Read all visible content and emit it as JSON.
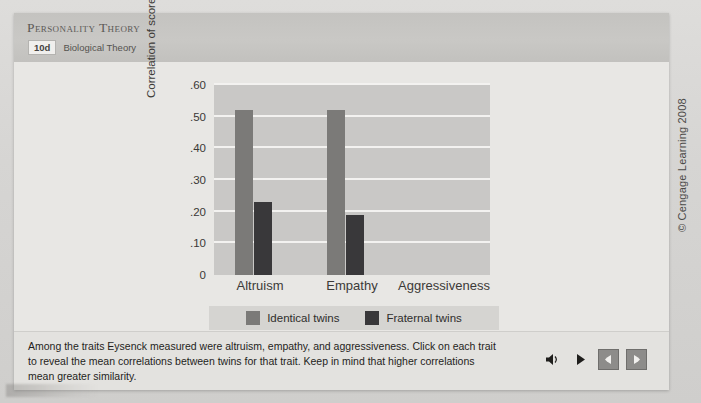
{
  "header": {
    "title": "Personality Theory",
    "chapter_number": "10d",
    "chapter_name": "Biological Theory"
  },
  "chart_data": {
    "type": "bar",
    "title": "",
    "xlabel": "",
    "ylabel": "Correlation of scores",
    "categories": [
      "Altruism",
      "Empathy",
      "Aggressiveness"
    ],
    "series": [
      {
        "name": "Identical twins",
        "color": "#7b7a78",
        "values": [
          0.52,
          0.52,
          null
        ]
      },
      {
        "name": "Fraternal twins",
        "color": "#39383a",
        "values": [
          0.23,
          0.19,
          null
        ]
      }
    ],
    "ylim": [
      0,
      0.6
    ],
    "ytick_values": [
      0,
      0.1,
      0.2,
      0.3,
      0.4,
      0.5,
      0.6
    ],
    "ytick_labels": [
      "0",
      ".10",
      ".20",
      ".30",
      ".40",
      ".50",
      ".60"
    ],
    "grid": true,
    "legend_position": "bottom",
    "plot_background": "#c9c8c6",
    "gridline_color": "#f3f2f0"
  },
  "legend": {
    "items": [
      {
        "label": "Identical twins",
        "color": "#7b7a78"
      },
      {
        "label": "Fraternal twins",
        "color": "#39383a"
      }
    ]
  },
  "caption": {
    "text": "Among the traits Eysenck measured were altruism, empathy, and aggressiveness. Click on each trait to reveal the mean correlations between twins for that trait. Keep in mind that higher correlations mean greater similarity."
  },
  "controls": [
    {
      "name": "audio-icon",
      "label": "Audio"
    },
    {
      "name": "play-icon",
      "label": "Play"
    },
    {
      "name": "previous-icon",
      "label": "Previous"
    },
    {
      "name": "next-icon",
      "label": "Next"
    }
  ],
  "copyright": "© Cengage Learning 2008"
}
